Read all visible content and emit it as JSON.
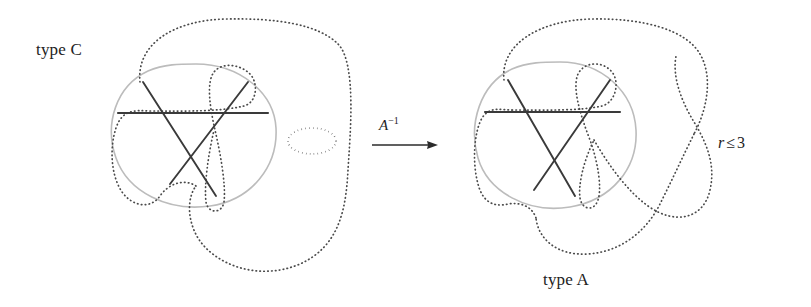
{
  "figure": {
    "kind": "knot-diagram-transformation",
    "background_color": "#ffffff",
    "labels": {
      "left_diagram_label": "type C",
      "right_diagram_label": "type A",
      "arrow_label_base": "A",
      "arrow_label_exponent": "−1",
      "arrow_label_full": "A⁻¹",
      "condition_variable": "r",
      "condition_operator": "≤",
      "condition_value": "3",
      "condition_full": "r ≤ 3"
    },
    "colors": {
      "dotted_curve": "#4a4a4a",
      "solid_blob": "#b8b8b8",
      "triangle_chord": "#3a3a3a",
      "arrow": "#2b2b2b",
      "text": "#232323",
      "background": "#ffffff"
    },
    "elements": {
      "arrow": {
        "x1": 372,
        "y1": 145,
        "x2": 437,
        "y2": 145,
        "head": "right"
      },
      "left_diagram": {
        "blob_center": [
          196,
          140
        ],
        "chord_line": {
          "x1": 118,
          "y1": 113,
          "x2": 268,
          "y2": 113
        },
        "triangle_vertices": [
          [
            143,
            82
          ],
          [
            248,
            82
          ],
          [
            196,
            190
          ]
        ],
        "small_loop_center": [
          313,
          142
        ],
        "crossing_count": 3
      },
      "right_diagram": {
        "blob_center": [
          561,
          140
        ],
        "chord_line": {
          "x1": 485,
          "y1": 112,
          "x2": 620,
          "y2": 112
        },
        "triangle_vertices": [
          [
            508,
            80
          ],
          [
            610,
            80
          ],
          [
            560,
            190
          ]
        ],
        "crossing_point": [
          690,
          145
        ],
        "crossing_count": 3
      }
    }
  }
}
